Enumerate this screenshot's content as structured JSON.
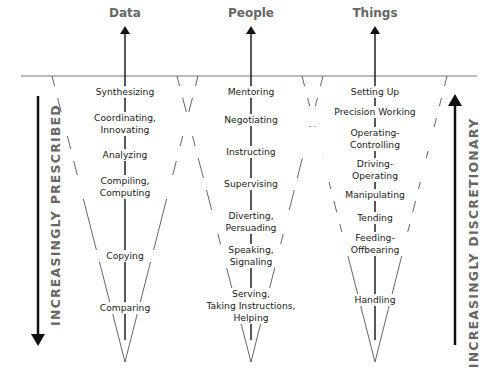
{
  "columns": [
    {
      "title": "Data",
      "items": [
        [
          "Synthesizing"
        ],
        [
          "Coordinating,",
          "Innovating"
        ],
        [
          "Analyzing"
        ],
        [
          "Compiling,",
          "Computing"
        ],
        [
          "Copying"
        ],
        [
          "Comparing"
        ]
      ]
    },
    {
      "title": "People",
      "items": [
        [
          "Mentoring"
        ],
        [
          "Negotiating"
        ],
        [
          "Instructing"
        ],
        [
          "Supervising"
        ],
        [
          "Diverting,",
          "Persuading"
        ],
        [
          "Speaking,",
          "Signaling"
        ],
        [
          "Serving,",
          "Taking Instructions,",
          "Helping"
        ]
      ]
    },
    {
      "title": "Things",
      "items": [
        [
          "Setting Up"
        ],
        [
          "Precision Working"
        ],
        [
          "Operating-",
          "Controlling"
        ],
        [
          "Driving-",
          "Operating"
        ],
        [
          "Manipulating"
        ],
        [
          "Tending"
        ],
        [
          "Feeding-",
          "Offbearing"
        ],
        [
          "Handling"
        ]
      ]
    }
  ],
  "side_labels": {
    "left": "INCREASINGLY PRESCRIBED",
    "right": "INCREASINGLY DISCRETIONARY"
  },
  "colors": {
    "title_gray": "#666666",
    "line": "#555555",
    "arrow": "#111111",
    "text": "#222222"
  }
}
